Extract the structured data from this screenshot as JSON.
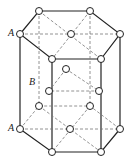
{
  "labels": {
    "top_a": "A",
    "mid_b": "B",
    "bottom_a": "A"
  },
  "colors": {
    "line": "#222222",
    "dash": "#777777"
  }
}
